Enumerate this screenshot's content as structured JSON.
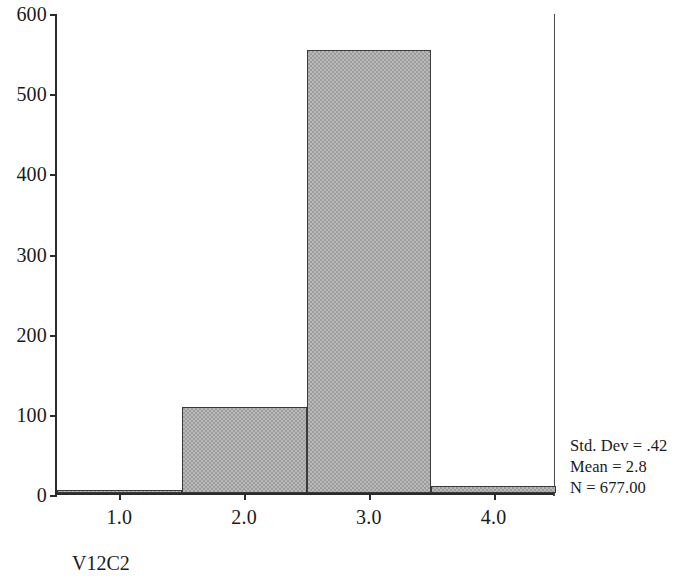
{
  "chart_data": {
    "type": "bar",
    "title": "",
    "subtitle": "",
    "xlabel": "V12C2",
    "ylabel": "",
    "categories": [
      "1.0",
      "2.0",
      "3.0",
      "4.0"
    ],
    "values": [
      2,
      107,
      553,
      9
    ],
    "bin_edges": [
      0.5,
      1.5,
      2.5,
      3.5,
      4.5
    ],
    "xlim": [
      0.5,
      4.5
    ],
    "ylim": [
      0,
      600
    ],
    "xticks": [
      "1.0",
      "2.0",
      "3.0",
      "4.0"
    ],
    "yticks": [
      "0",
      "100",
      "200",
      "300",
      "400",
      "500",
      "600"
    ],
    "ytick_values": [
      0,
      100,
      200,
      300,
      400,
      500,
      600
    ],
    "grid": false,
    "legend": "none",
    "bar_fill_color": "#9c9c9c",
    "bar_edge_color": "#3a3a3a",
    "axis_color": "#2b2b2b",
    "background_color": "#ffffff",
    "annotations": [
      "Std. Dev = .42",
      "Mean = 2.8",
      "N = 677.00"
    ]
  },
  "stats": {
    "std_dev_line": "Std. Dev = .42",
    "mean_line": "Mean = 2.8",
    "n_line": "N = 677.00"
  }
}
